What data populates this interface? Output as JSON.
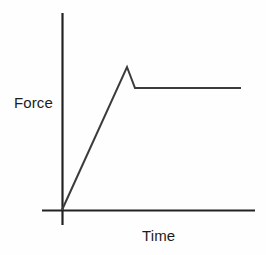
{
  "figure": {
    "background_color": "#fefefe",
    "width": 266,
    "height": 255
  },
  "chart_data": {
    "type": "line",
    "title": "",
    "xlabel": "Time",
    "ylabel": "Force",
    "grid": false,
    "legend": null,
    "axes": {
      "x_axis_color": "#222222",
      "y_axis_color": "#222222",
      "line_width_px": 2,
      "x_tick_labels": [],
      "y_tick_labels": [],
      "origin_px": [
        62,
        210
      ],
      "x_axis_extent_px": [
        42,
        255
      ],
      "y_axis_extent_px": [
        13,
        225
      ]
    },
    "series": [
      {
        "name": "Force vs Time",
        "color": "#3b3b3b",
        "line_width_px": 2,
        "points_px": [
          [
            62,
            210
          ],
          [
            127,
            67
          ],
          [
            135,
            88
          ],
          [
            241,
            88
          ]
        ],
        "description_points": [
          {
            "label": "origin",
            "x": 0,
            "y": 0
          },
          {
            "label": "peak",
            "x": 0.31,
            "y": 1.0
          },
          {
            "label": "drop",
            "x": 0.35,
            "y": 0.855
          },
          {
            "label": "plateau-end",
            "x": 0.85,
            "y": 0.855
          }
        ]
      }
    ],
    "annotations": []
  },
  "labels": {
    "ylabel_text": "Force",
    "xlabel_text": "Time"
  }
}
